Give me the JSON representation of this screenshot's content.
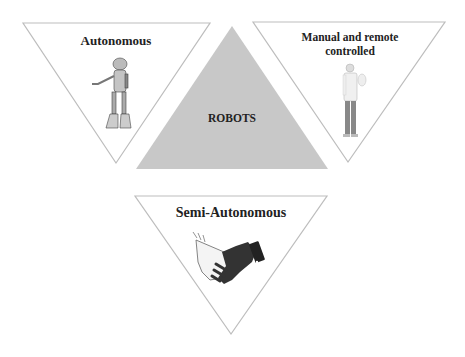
{
  "diagram": {
    "center": {
      "label": "ROBOTS",
      "fill": "#c8c8c8"
    },
    "categories": [
      {
        "id": "autonomous",
        "label": "Autonomous",
        "icon": "robot-icon"
      },
      {
        "id": "manual",
        "label": "Manual and remote controlled",
        "line1": "Manual and remote",
        "line2": "controlled",
        "icon": "person-icon"
      },
      {
        "id": "semi",
        "label": "Semi-Autonomous",
        "icon": "handshake-icon"
      }
    ],
    "colors": {
      "outline": "#bdbdbd",
      "text": "#222222",
      "center_fill": "#c8c8c8"
    }
  }
}
